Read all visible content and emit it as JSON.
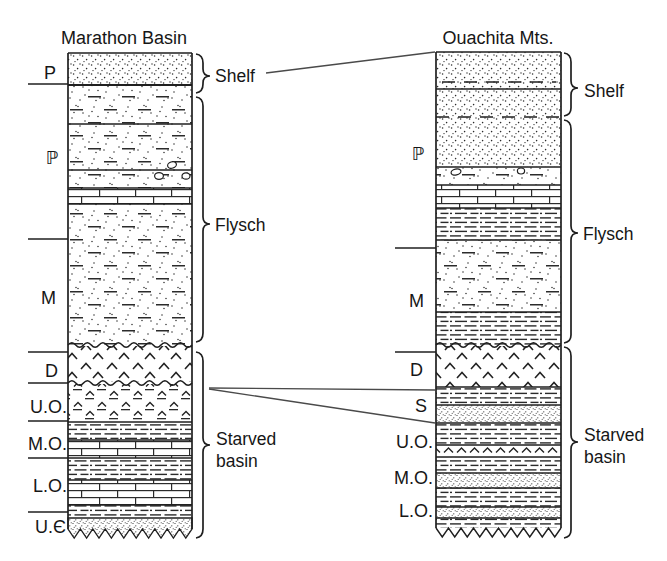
{
  "diagram": {
    "kind": "stratigraphic-correlation-columns",
    "background_color": "#ffffff",
    "ink_color": "#1f1f1f"
  },
  "left_column": {
    "title": "Marathon Basin",
    "ages": [
      "P",
      "ℙ",
      "M",
      "D",
      "U.O.",
      "M.O.",
      "L.O.",
      "U.Є"
    ],
    "zones": {
      "shelf": "Shelf",
      "flysch": "Flysch",
      "starved_line1": "Starved",
      "starved_line2": "basin"
    },
    "units_top_to_bottom": [
      {
        "age": "P",
        "lithology": "sandstone-dots"
      },
      {
        "age": "ℙ",
        "lithology": "sandy-shale-dots-and-dashes"
      },
      {
        "age": "ℙ",
        "lithology": "shale-with-pebbles"
      },
      {
        "age": "ℙ",
        "lithology": "limestone-bricks"
      },
      {
        "age": "M",
        "lithology": "sandy-shale-dots-and-dashes"
      },
      {
        "age": "D",
        "lithology": "novaculite-chevrons",
        "top_contact": "wavy",
        "bottom_contact": "wavy"
      },
      {
        "age": "U.O.",
        "lithology": "bedded-chert-chevrons-and-dashes"
      },
      {
        "age": "M.O.",
        "lithology": "shale-over-limestone"
      },
      {
        "age": "L.O.",
        "lithology": "shale-over-limestone"
      },
      {
        "age": "U.Є",
        "lithology": "shale-and-sandstone",
        "bottom_contact": "zigzag"
      }
    ]
  },
  "right_column": {
    "title": "Ouachita Mts.",
    "ages": [
      "ℙ",
      "M",
      "D",
      "S",
      "U.O.",
      "M.O.",
      "L.O."
    ],
    "zones": {
      "shelf": "Shelf",
      "flysch": "Flysch",
      "starved_line1": "Starved",
      "starved_line2": "basin"
    },
    "units_top_to_bottom": [
      {
        "age": "ℙ",
        "lithology": "sandstone-dots"
      },
      {
        "age": "ℙ",
        "lithology": "shale-with-pebbles"
      },
      {
        "age": "ℙ",
        "lithology": "limestone-bricks"
      },
      {
        "age": "ℙ",
        "lithology": "shale-dashes"
      },
      {
        "age": "M",
        "lithology": "sandstone-dots-and-dashes"
      },
      {
        "age": "M",
        "lithology": "shale-dashes",
        "bottom_contact": "wavy"
      },
      {
        "age": "D",
        "lithology": "novaculite-chevrons",
        "top_contact": "wavy"
      },
      {
        "age": "S",
        "lithology": "shale-over-sandstone"
      },
      {
        "age": "U.O.",
        "lithology": "shale-over-chert-chevrons"
      },
      {
        "age": "M.O.",
        "lithology": "shale-over-sandstone"
      },
      {
        "age": "L.O.",
        "lithology": "shale-and-sandstone",
        "bottom_contact": "zigzag"
      }
    ]
  },
  "correlation_lines": [
    {
      "from": "left-shelf-label",
      "to": "right-column-top"
    },
    {
      "from": "left-D-UO-contact",
      "to": "right-S-top"
    },
    {
      "from": "left-D-UO-contact",
      "to": "right-S-base"
    }
  ]
}
